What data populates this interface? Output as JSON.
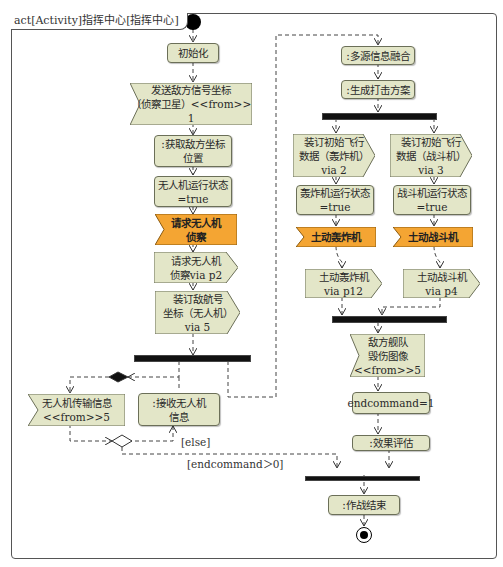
{
  "frame": {
    "title": "act[Activity]指挥中心[指挥中心]"
  },
  "colors": {
    "action_fill": "#e3e6c8",
    "signal_highlight": "#f4a533",
    "border": "#6b6f58",
    "bar": "#111111"
  },
  "left_flow": {
    "init": "初始化",
    "send_enemy_signal": "发送敌方信号坐标\n（侦察卫星）<<from>>\n1",
    "get_enemy_position": ":获取敌方坐标\n位置",
    "uav_state": "无人机运行状态\n=true",
    "request_uav_recon_signal": "请求无人机\n侦察",
    "request_uav_recon_send": "请求无人机\n侦察via p2",
    "bind_track_coords": "装订敌航号\n坐标（无人机）\nvia 5",
    "uav_transmit_info": "无人机传输信息\n<<from>>5",
    "receive_uav_info": ":接收无人机\n信息"
  },
  "guards": {
    "else": "[else]",
    "endcommand_gt0": "[endcommand＞0]"
  },
  "right_flow": {
    "multi_source_fusion": ":多源信息融合",
    "generate_strike_plan": ":生成打击方案",
    "bind_bomber_data": "装订初始飞行\n数据（轰炸机）\nvia 2",
    "bind_fighter_data": "装订初始飞行\n数据（战斗机）\nvia 3",
    "bomber_state": "轰炸机运行状态\n=true",
    "fighter_state": "战斗机运行状态\n=true",
    "launch_bomber_signal": "土动轰炸机",
    "launch_fighter_signal": "土动战斗机",
    "launch_bomber_send": "土动轰炸机\nvia p12",
    "launch_fighter_send": "土动战斗机\nvia p4",
    "enemy_fleet_damage": "敌方舰队\n毁伤图像\n<<from>>5",
    "endcommand": "endcommand=1",
    "effect_eval": ":效果评估",
    "end_operation": ":作战结束"
  }
}
